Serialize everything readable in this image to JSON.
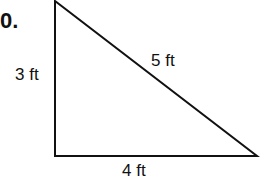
{
  "problem": {
    "number": "0."
  },
  "triangle": {
    "type": "right triangle",
    "sides": {
      "vertical": "3 ft",
      "hypotenuse": "5 ft",
      "horizontal": "4 ft"
    },
    "colors": {
      "stroke": "#111111",
      "fill": "#ffffff"
    }
  }
}
